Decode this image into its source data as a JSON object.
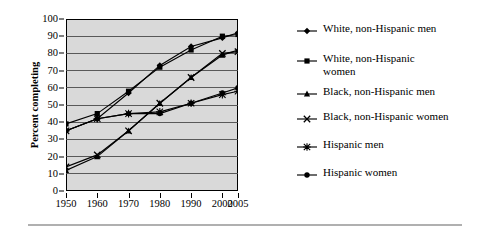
{
  "chart_data": {
    "type": "line",
    "title": "",
    "xlabel": "",
    "ylabel": "Percent completing",
    "ylim": [
      0,
      100
    ],
    "ytick_step": 10,
    "grid": true,
    "legend_position": "right",
    "plot_background": "#d9d9d9",
    "line_color": "#000000",
    "categories": [
      "1950",
      "1960",
      "1970",
      "1980",
      "1990",
      "2000",
      "2005"
    ],
    "x": [
      1950,
      1960,
      1970,
      1980,
      1990,
      2000,
      2005
    ],
    "yticks": [
      "0",
      "10",
      "20",
      "30",
      "40",
      "50",
      "60",
      "70",
      "80",
      "90",
      "100"
    ],
    "series": [
      {
        "name": "White, non-Hispanic men",
        "marker": "diamond",
        "values": [
          35,
          42,
          57,
          73,
          84,
          89,
          92
        ]
      },
      {
        "name": "White, non-Hispanic\nwomen",
        "marker": "square",
        "values": [
          39,
          45,
          58,
          72,
          82,
          90,
          91
        ]
      },
      {
        "name": "Black, non-Hispanic men",
        "marker": "triangle",
        "values": [
          12,
          20,
          35,
          51,
          66,
          79,
          82
        ]
      },
      {
        "name": "Black, non-Hispanic women",
        "marker": "cross",
        "values": [
          14,
          21,
          35,
          51,
          66,
          80,
          81
        ]
      },
      {
        "name": "Hispanic men",
        "marker": "asterisk",
        "values": [
          35,
          42,
          45,
          46,
          51,
          56,
          58
        ]
      },
      {
        "name": "Hispanic women",
        "marker": "circle",
        "values": [
          35,
          42,
          45,
          45,
          51,
          57,
          60
        ]
      }
    ]
  }
}
